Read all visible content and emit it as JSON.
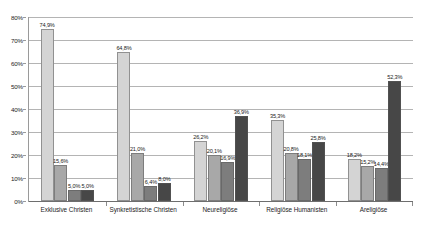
{
  "chart_data": {
    "type": "bar",
    "title": "",
    "xlabel": "",
    "ylabel": "",
    "ylim": [
      0,
      80
    ],
    "ytick_labels": [
      "0%",
      "10%",
      "20%",
      "30%",
      "40%",
      "50%",
      "60%",
      "70%",
      "80%"
    ],
    "yticks": [
      0,
      10,
      20,
      30,
      40,
      50,
      60,
      70,
      80
    ],
    "grid": true,
    "legend": "none",
    "categories": [
      "Exklusive Christen",
      "Synkretistische Christen",
      "Neureligiöse",
      "Religiöse Humanisten",
      "Areligiöse"
    ],
    "series": [
      {
        "name": "series-1",
        "color": "#d4d4d4",
        "values": [
          74.9,
          64.8,
          26.2,
          35.3,
          18.2
        ],
        "labels": [
          "74,9%",
          "64,8%",
          "26,2%",
          "35,3%",
          "18,2%"
        ]
      },
      {
        "name": "series-2",
        "color": "#a8a8a8",
        "values": [
          15.6,
          21.0,
          20.1,
          20.8,
          15.2
        ],
        "labels": [
          "15,6%",
          "21,0%",
          "20,1%",
          "20,8%",
          "15,2%"
        ]
      },
      {
        "name": "series-3",
        "color": "#7d7d7d",
        "values": [
          5.0,
          6.4,
          16.9,
          18.1,
          14.4
        ],
        "labels": [
          "5,0%",
          "6,4%",
          "16,9%",
          "18,1%",
          "14,4%"
        ]
      },
      {
        "name": "series-4",
        "color": "#474747",
        "values": [
          5.0,
          8.0,
          36.9,
          25.8,
          52.3
        ],
        "labels": [
          "5,0%",
          "8,0%",
          "36,9%",
          "25,8%",
          "52,3%"
        ]
      }
    ]
  },
  "axis": {
    "gridline_color": "#b4b4b4",
    "baseline_color": "#6e6e6e",
    "background": "#ffffff"
  }
}
